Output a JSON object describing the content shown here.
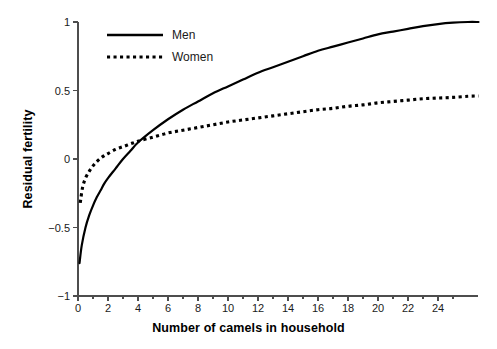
{
  "chart_data": {
    "type": "line",
    "title": "",
    "xlabel": "Number of camels in household",
    "ylabel": "Residual fertility",
    "xlim": [
      -0.5,
      26.7
    ],
    "ylim": [
      -1,
      1
    ],
    "grid": false,
    "legend_position": "top-left-inside",
    "xticks": [
      0,
      2,
      4,
      6,
      8,
      10,
      12,
      14,
      16,
      18,
      20,
      22,
      24
    ],
    "xtick_labels": [
      "0",
      "2",
      "4",
      "6",
      "8",
      "10",
      "12",
      "14",
      "16",
      "18",
      "20",
      "22",
      "24"
    ],
    "xminor_ticks": [
      1,
      3,
      5,
      7,
      9,
      11,
      13,
      15,
      17,
      19,
      21,
      23,
      25
    ],
    "yticks": [
      1,
      0.5,
      0,
      -0.5,
      -1
    ],
    "ytick_labels": [
      "1",
      "0.5",
      "0",
      "−0.5",
      "−1"
    ],
    "series": [
      {
        "name": "Men",
        "style": "solid",
        "color": "#000000",
        "x": [
          0.1,
          0.25,
          0.5,
          0.75,
          1,
          1.25,
          1.5,
          1.75,
          2,
          2.5,
          3,
          3.5,
          4,
          5,
          6,
          7,
          8,
          9,
          10,
          11,
          12,
          13,
          14,
          15,
          16,
          17,
          18,
          19,
          20,
          21,
          22,
          23,
          24,
          25,
          26,
          26.7
        ],
        "y": [
          -0.76,
          -0.63,
          -0.5,
          -0.41,
          -0.34,
          -0.28,
          -0.23,
          -0.18,
          -0.14,
          -0.07,
          0.0,
          0.06,
          0.12,
          0.21,
          0.29,
          0.36,
          0.42,
          0.48,
          0.53,
          0.58,
          0.63,
          0.67,
          0.71,
          0.75,
          0.79,
          0.82,
          0.85,
          0.88,
          0.91,
          0.93,
          0.95,
          0.97,
          0.985,
          0.995,
          1.0,
          1.0
        ]
      },
      {
        "name": "Women",
        "style": "dotted",
        "color": "#000000",
        "x": [
          0.15,
          0.3,
          0.5,
          0.75,
          1,
          1.25,
          1.5,
          1.75,
          2,
          2.5,
          3,
          3.5,
          4,
          5,
          6,
          7,
          8,
          9,
          10,
          11,
          12,
          13,
          14,
          15,
          16,
          17,
          18,
          19,
          20,
          21,
          22,
          23,
          24,
          25,
          26,
          26.7
        ],
        "y": [
          -0.32,
          -0.21,
          -0.14,
          -0.09,
          -0.05,
          -0.02,
          0.005,
          0.025,
          0.04,
          0.07,
          0.09,
          0.11,
          0.13,
          0.16,
          0.19,
          0.21,
          0.23,
          0.25,
          0.27,
          0.285,
          0.3,
          0.315,
          0.33,
          0.345,
          0.36,
          0.37,
          0.385,
          0.395,
          0.41,
          0.42,
          0.43,
          0.44,
          0.445,
          0.45,
          0.458,
          0.46
        ]
      }
    ],
    "legend": [
      {
        "label": "Men",
        "style": "solid"
      },
      {
        "label": "Women",
        "style": "dotted"
      }
    ]
  }
}
